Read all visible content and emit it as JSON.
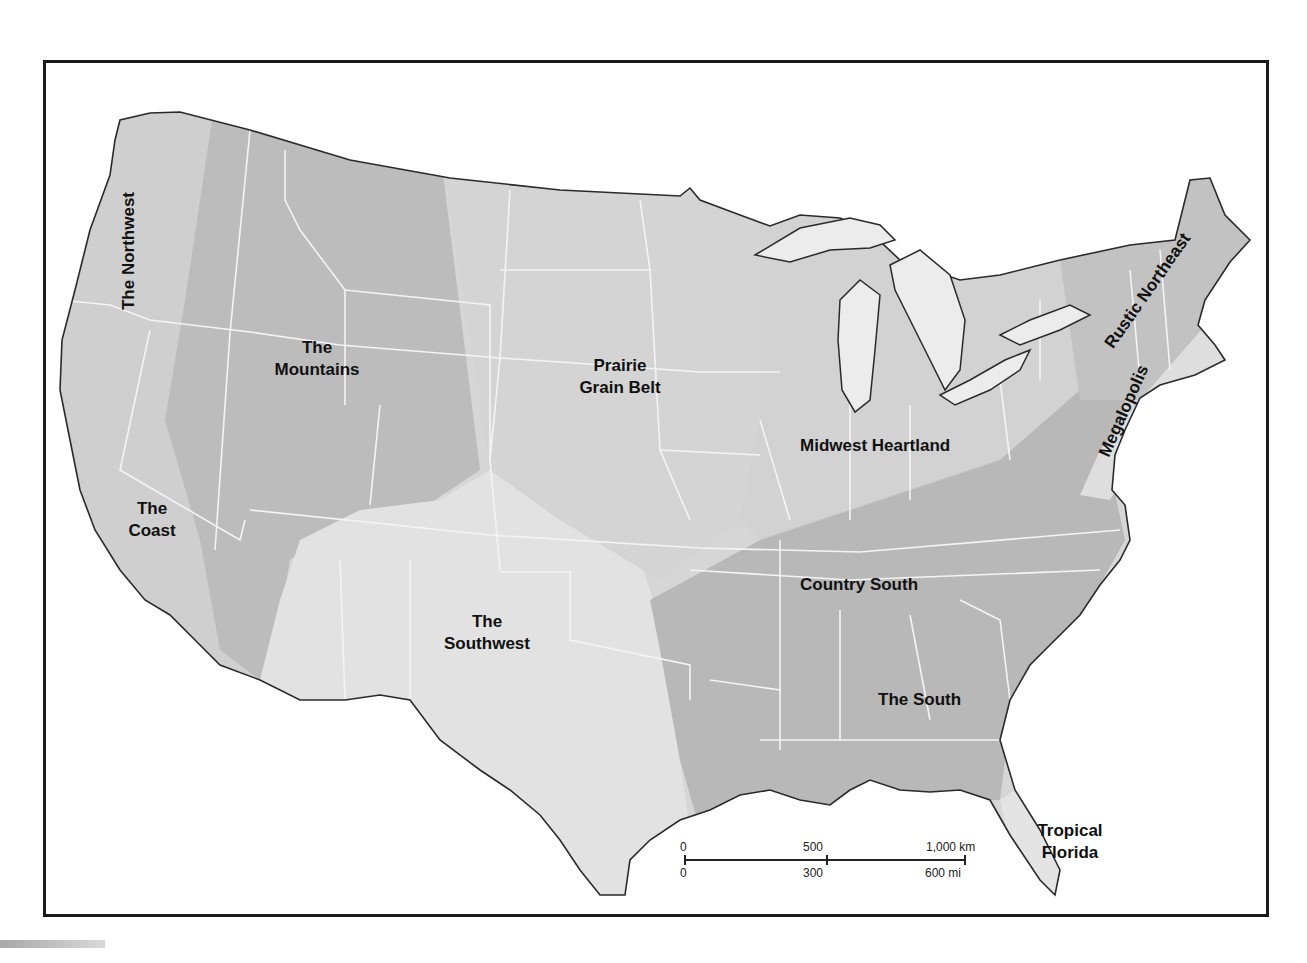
{
  "map": {
    "title": "",
    "colors": {
      "background": "#ffffff",
      "frame": "#1a1a1a",
      "state_borders": "#f2f2f2",
      "coastline": "#2a2a2a",
      "region_light": "#d9d9d9",
      "region_mid": "#c6c6c6",
      "region_dark": "#b3b3b3",
      "water": "#ececec"
    },
    "regions": [
      {
        "id": "northwest",
        "label": "The Northwest",
        "rotation": -90
      },
      {
        "id": "mountains",
        "label_line1": "The",
        "label_line2": "Mountains"
      },
      {
        "id": "coast",
        "label_line1": "The",
        "label_line2": "Coast"
      },
      {
        "id": "southwest",
        "label_line1": "The",
        "label_line2": "Southwest"
      },
      {
        "id": "prairie",
        "label_line1": "Prairie",
        "label_line2": "Grain Belt"
      },
      {
        "id": "midwest",
        "label": "Midwest Heartland"
      },
      {
        "id": "country_south",
        "label": "Country South"
      },
      {
        "id": "south",
        "label": "The South"
      },
      {
        "id": "rustic_northeast",
        "label": "Rustic Northeast",
        "rotation": -52
      },
      {
        "id": "megalopolis",
        "label": "Megalopolis",
        "rotation": -62
      },
      {
        "id": "tropical_florida",
        "label_line1": "Tropical",
        "label_line2": "Florida"
      }
    ],
    "scale_bar": {
      "km": {
        "zero": "0",
        "mid": "500",
        "end": "1,000 km"
      },
      "mi": {
        "zero": "0",
        "mid": "300",
        "end": "600 mi"
      }
    }
  }
}
